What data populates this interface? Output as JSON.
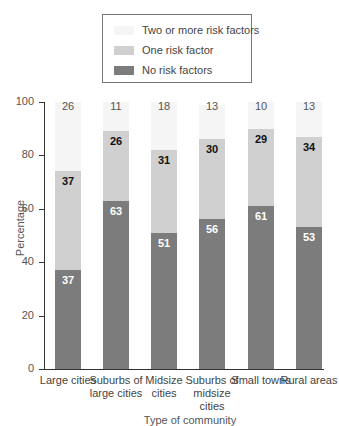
{
  "legend": {
    "items": [
      {
        "label": "Two or more risk factors",
        "color": "#f5f5f5"
      },
      {
        "label": "One risk factor",
        "color": "#d0d0d0"
      },
      {
        "label": "No risk factors",
        "color": "#7c7c7c"
      }
    ]
  },
  "axes": {
    "ylabel": "Percentage",
    "xlabel": "Type of community",
    "yticks": [
      "0",
      "20",
      "40",
      "60",
      "80",
      "100"
    ]
  },
  "categories": [
    "Large cities",
    "Suburbs of large cities",
    "Midsize cities",
    "Suburbs of midsize cities",
    "Small towns",
    "Rural areas"
  ],
  "bars": [
    {
      "none": "37",
      "one": "37",
      "two": "26"
    },
    {
      "none": "63",
      "one": "26",
      "two": "11"
    },
    {
      "none": "51",
      "one": "31",
      "two": "18"
    },
    {
      "none": "56",
      "one": "30",
      "two": "13"
    },
    {
      "none": "61",
      "one": "29",
      "two": "10"
    },
    {
      "none": "53",
      "one": "34",
      "two": "13"
    }
  ],
  "chart_data": {
    "type": "bar",
    "stacked": true,
    "title": "",
    "xlabel": "Type of community",
    "ylabel": "Percentage",
    "ylim": [
      0,
      100
    ],
    "yticks": [
      0,
      20,
      40,
      60,
      80,
      100
    ],
    "legend_position": "top",
    "categories": [
      "Large cities",
      "Suburbs of large cities",
      "Midsize cities",
      "Suburbs of midsize cities",
      "Small towns",
      "Rural areas"
    ],
    "series": [
      {
        "name": "No risk factors",
        "values": [
          37,
          63,
          51,
          56,
          61,
          53
        ]
      },
      {
        "name": "One risk factor",
        "values": [
          37,
          26,
          31,
          30,
          29,
          34
        ]
      },
      {
        "name": "Two or more risk factors",
        "values": [
          26,
          11,
          18,
          13,
          10,
          13
        ]
      }
    ]
  }
}
